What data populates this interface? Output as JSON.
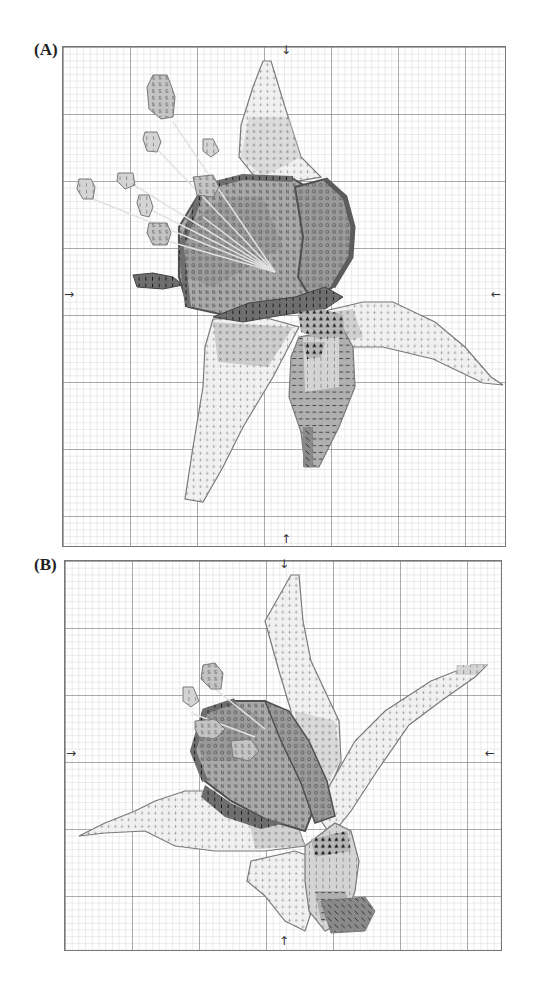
{
  "figure": {
    "panels": [
      {
        "id": "A",
        "label": "(A)",
        "description": "Cross-stitch chart of a lily flower, petals spread, stamens toward upper left",
        "box": {
          "left": 62,
          "top": 46,
          "width": 442,
          "height": 499
        },
        "center_arrows": {
          "top": "↓",
          "bottom": "↑",
          "left": "→",
          "right": "←"
        }
      },
      {
        "id": "B",
        "label": "(B)",
        "description": "Cross-stitch chart of a lily flower, alternate pose with petals extending left and upper right",
        "box": {
          "left": 64,
          "top": 560,
          "width": 436,
          "height": 389
        },
        "center_arrows": {
          "top": "↓",
          "bottom": "↑",
          "left": "→",
          "right": "←"
        }
      }
    ],
    "grid": {
      "cell_px": 6.7,
      "major_every": 10,
      "minor_color": "#c8c8c8",
      "major_color": "#6a6a6a"
    },
    "stitch_symbols": [
      "+",
      "•",
      "×",
      "N",
      "O",
      "I",
      "S",
      "▲",
      "—",
      "\\",
      "Z"
    ],
    "colors": {
      "lightest": "#f2f2f2",
      "light": "#d9d9d9",
      "mid": "#bdbdbd",
      "dark": "#8e8e8e",
      "darkest": "#5c5c5c",
      "outline": "#7a7a7a",
      "stamen_line": "#e0e0e0"
    }
  }
}
